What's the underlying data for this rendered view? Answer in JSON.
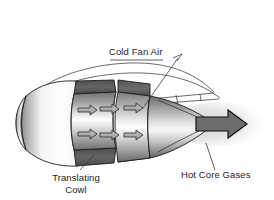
{
  "figure": {
    "title_present": false,
    "background_color": "#ffffff"
  },
  "labels": [
    {
      "id": "cold-fan-air",
      "text": "Cold Fan Air",
      "x": 109,
      "y": 55,
      "anchor": "start"
    },
    {
      "id": "hot-core-gases",
      "text": "Hot Core Gases",
      "x": 181,
      "y": 178,
      "anchor": "start"
    },
    {
      "id": "translating-cowl-line1",
      "text": "Translating",
      "x": 76,
      "y": 181,
      "anchor": "middle"
    },
    {
      "id": "translating-cowl-line2",
      "text": "Cowl",
      "x": 76,
      "y": 193,
      "anchor": "middle"
    }
  ],
  "colors": {
    "background": "#ffffff",
    "text": "#1a1a1a",
    "leader_line": "#3a3a3a",
    "outline": "#1d1d1d",
    "cutaway_dark": "#5a5a5a",
    "cutaway_darker": "#4a4a4a",
    "metal_light": "#fbfbfb",
    "metal_mid": "#bdbdbd",
    "metal_dark": "#6f6f6f",
    "arrow_fill": "#a8a8a8",
    "exhaust_arrow_fill": "#6d6d6d",
    "plume": "#d7d7d7"
  },
  "flow_arrows": {
    "cold_fan_air_count": 6,
    "hot_core_count": 1,
    "direction": "left-to-right"
  },
  "parts": [
    {
      "name": "nose-fairing",
      "description": "rounded front nacelle lip"
    },
    {
      "name": "translating-cowl",
      "description": "sliding cowl ring, cutaway"
    },
    {
      "name": "fan-duct-ring-1",
      "description": "forward bypass duct segment"
    },
    {
      "name": "fan-duct-ring-2",
      "description": "aft bypass duct segment"
    },
    {
      "name": "core-exhaust-cone",
      "description": "tapering hot core nozzle"
    },
    {
      "name": "outer-cowl-skin",
      "description": "thin outer nacelle line work"
    }
  ]
}
